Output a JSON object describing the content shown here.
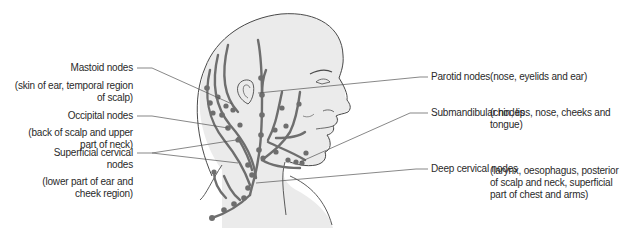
{
  "diagram": {
    "colors": {
      "skin_fill": "#ebebeb",
      "outline": "#4a4a4a",
      "vessel": "#6e6e6e",
      "leader_line": "#555555",
      "text": "#2a2a2a"
    },
    "left_labels": [
      {
        "name": "Mastoid nodes",
        "description_line1": "(skin of ear, temporal region",
        "description_line2": "of scalp)"
      },
      {
        "name": "Occipital nodes",
        "description_line1": "(back of scalp and upper",
        "description_line2": "part of neck)"
      },
      {
        "name_line1": "Superficial cervical",
        "name_line2": "nodes",
        "description_line1": "(lower part of ear and",
        "description_line2": "cheek region)"
      }
    ],
    "right_labels": [
      {
        "name": "Parotid nodes",
        "description": "(nose, eyelids and ear)"
      },
      {
        "name": "Submandibular nodes",
        "description_line1": "(chin, lips, nose, cheeks and",
        "description_line2": "tongue)"
      },
      {
        "name": "Deep cervical nodes",
        "description_line1": "(larynx, oesophagus, posterior",
        "description_line2": "of scalp and neck, superficial",
        "description_line3": "part of chest and arms)"
      }
    ]
  }
}
